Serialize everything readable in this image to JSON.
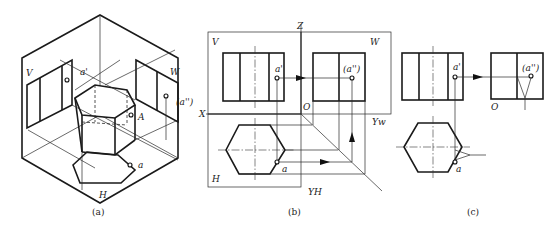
{
  "figure_a": {
    "caption": "(a)",
    "labels": {
      "v_plane": "V",
      "w_plane": "W",
      "h_plane": "H",
      "point_front": "a'",
      "point_side": "(a'')",
      "point_space": "A",
      "point_top": "a"
    }
  },
  "figure_b": {
    "caption": "(b)",
    "labels": {
      "v_plane": "V",
      "w_plane": "W",
      "h_plane": "H",
      "axis_z": "Z",
      "axis_x": "X",
      "origin": "O",
      "axis_yw": "Yw",
      "axis_yh": "YH",
      "point_front": "a'",
      "point_side": "(a'')",
      "point_top": "a"
    }
  },
  "figure_c": {
    "caption": "(c)",
    "labels": {
      "origin": "O",
      "point_front": "a'",
      "point_side": "(a'')",
      "point_top": "a"
    }
  }
}
